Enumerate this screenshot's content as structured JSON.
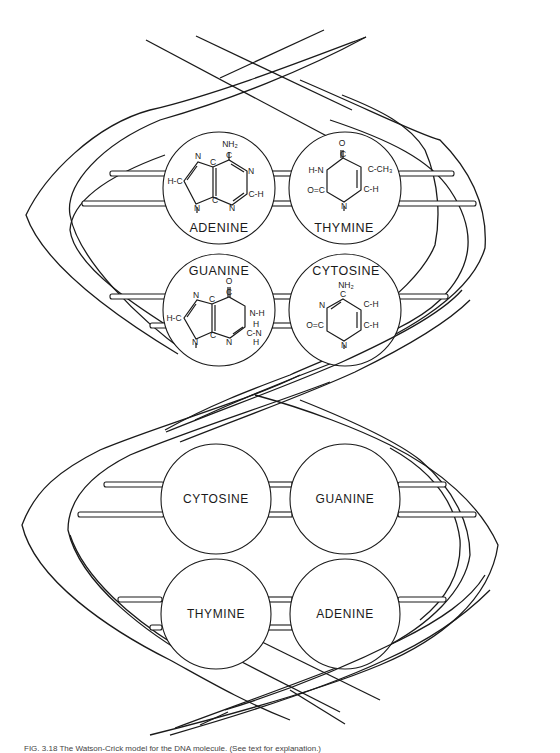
{
  "figure": {
    "stroke_color": "#1a1a1a",
    "background": "#ffffff"
  },
  "upper_pairs": [
    {
      "left": {
        "name": "ADENINE",
        "atoms": {
          "nh2": "NH₂",
          "c_top": "C",
          "n_right": "N",
          "c_h": "C-H",
          "n_bottom": "N",
          "c_mid_top": "C",
          "c_mid_bottom": "C",
          "n_five_top": "N",
          "h_c": "H-C",
          "n_nine": "N"
        }
      },
      "right": {
        "name": "THYMINE",
        "atoms": {
          "o": "O",
          "c_top": "C",
          "h_n": "H-N",
          "c_ch3": "C-CH₃",
          "o_c": "O=C",
          "c_h": "C-H",
          "n_bottom": "N"
        }
      }
    },
    {
      "left": {
        "name": "GUANINE",
        "atoms": {
          "o": "O",
          "c_top": "C",
          "n_h": "N-H",
          "c_mid_top": "C",
          "c_mid_bottom": "C",
          "n_five_top": "N",
          "h_c": "H-C",
          "n_nine": "N",
          "n_bottom": "N",
          "c_nh2": "C-N",
          "h_top": "H",
          "h_bottom": "H"
        }
      },
      "right": {
        "name": "CYTOSINE",
        "atoms": {
          "nh2": "NH₂",
          "c_top": "C",
          "n_left": "N",
          "c_h_top": "C-H",
          "o_c": "O=C",
          "c_h_bottom": "C-H",
          "n_bottom": "N"
        }
      }
    }
  ],
  "lower_pairs": [
    {
      "left": {
        "name": "CYTOSINE"
      },
      "right": {
        "name": "GUANINE"
      }
    },
    {
      "left": {
        "name": "THYMINE"
      },
      "right": {
        "name": "ADENINE"
      }
    }
  ],
  "caption": "FIG. 3.18  The Watson-Crick model for the DNA molecule. (See text for explanation.)"
}
